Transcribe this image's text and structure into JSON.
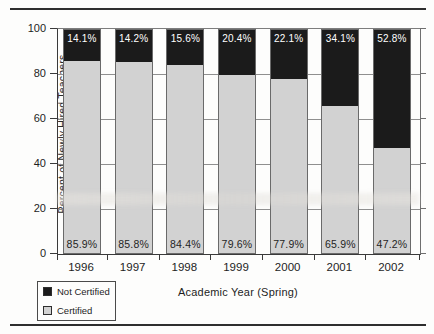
{
  "page": {
    "background": "#fdfdfc",
    "rule_color": "#2e2e2e"
  },
  "chart_data": {
    "type": "bar",
    "stacked": true,
    "categories": [
      "1996",
      "1997",
      "1998",
      "1999",
      "2000",
      "2001",
      "2002"
    ],
    "series": [
      {
        "name": "Not Certified",
        "color": "#1b1b1b",
        "label_color": "#ffffff",
        "values": [
          14.1,
          14.2,
          15.6,
          20.4,
          22.1,
          34.1,
          52.8
        ]
      },
      {
        "name": "Certified",
        "color": "#d2d2d2",
        "label_color": "#1f1f1f",
        "values": [
          85.9,
          85.8,
          84.4,
          79.6,
          77.9,
          65.9,
          47.2
        ]
      }
    ],
    "value_label_suffix": "%",
    "xlabel": "Academic Year (Spring)",
    "ylabel": "Percent of Newly Hired Teachers",
    "ylim": [
      0,
      100
    ],
    "yticks": [
      0,
      20,
      40,
      60,
      80,
      100
    ],
    "grid": true,
    "gridline_color": "#8f8f8f",
    "legend_position": "bottom-left"
  }
}
